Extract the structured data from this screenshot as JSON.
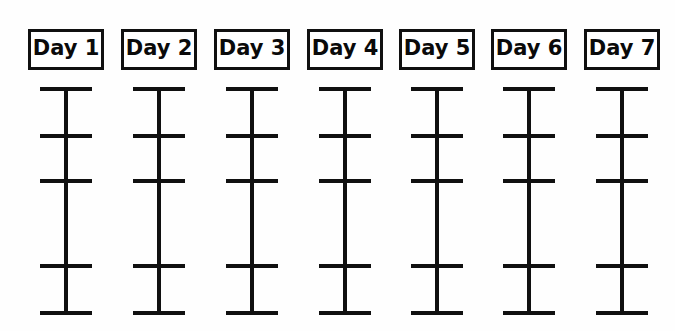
{
  "worksheet": {
    "title": "Weekly day tracker grid",
    "background_color": "#fefefe",
    "ink_color": "#101010",
    "columns": [
      {
        "label": "Day 1",
        "center_x": 66
      },
      {
        "label": "Day 2",
        "center_x": 159
      },
      {
        "label": "Day 3",
        "center_x": 252
      },
      {
        "label": "Day 4",
        "center_x": 345
      },
      {
        "label": "Day 5",
        "center_x": 437
      },
      {
        "label": "Day 6",
        "center_x": 529
      },
      {
        "label": "Day 7",
        "center_x": 622
      }
    ],
    "tick_rows_y": [
      87,
      134,
      179,
      264,
      311
    ],
    "stem": {
      "top_y": 87,
      "bottom_y": 315
    },
    "box": {
      "width": 76,
      "height": 41,
      "top_y": 29,
      "border_width": 3
    },
    "tick": {
      "width": 52,
      "thickness": 4
    }
  }
}
